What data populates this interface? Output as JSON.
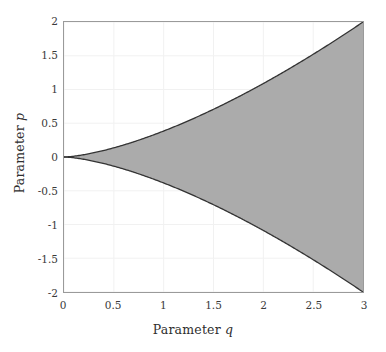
{
  "chart_data": {
    "type": "area",
    "title": "",
    "subtitle": "",
    "xlabel_text": "Parameter",
    "xlabel_symbol": "q",
    "ylabel_text": "Parameter",
    "ylabel_symbol": "p",
    "xlim": [
      0,
      3
    ],
    "ylim": [
      -2,
      2
    ],
    "xticks": [
      0,
      0.5,
      1,
      1.5,
      2,
      2.5,
      3
    ],
    "xticklabels": [
      "0",
      "0.5",
      "1",
      "1.5",
      "2",
      "2.5",
      "3"
    ],
    "yticks": [
      2,
      1.5,
      1,
      0.5,
      0,
      -0.5,
      -1,
      -1.5,
      -2
    ],
    "yticklabels": [
      "2",
      "1.5",
      "1",
      "0.5",
      "0",
      "-0.5",
      "-1",
      "-1.5",
      "-2"
    ],
    "grid": true,
    "grid_color": "#f1f1f1",
    "axis_color": "#9a9a9a",
    "legend": null,
    "legend_position": "none",
    "fill_color": "#ababab",
    "line_color": "#333333",
    "region_label": "shaded stability region",
    "series": [
      {
        "name": "upper boundary",
        "x": [
          0,
          0.15,
          0.3,
          0.45,
          0.6,
          0.75,
          0.9,
          1.0,
          1.2,
          1.35,
          1.5,
          1.65,
          1.8,
          2.0,
          2.1,
          2.25,
          2.4,
          2.55,
          2.7,
          2.85,
          3.0
        ],
        "y": [
          0,
          0.071,
          0.2,
          0.367,
          0.566,
          0.791,
          1.04,
          0.471,
          0.619,
          0.738,
          0.745,
          0.857,
          0.98,
          1.16,
          1.246,
          1.369,
          1.507,
          1.65,
          1.8,
          1.955,
          2.0
        ]
      },
      {
        "name": "lower boundary",
        "x": [
          0,
          0.15,
          0.3,
          0.45,
          0.6,
          0.75,
          0.9,
          1.0,
          1.2,
          1.35,
          1.5,
          1.65,
          1.8,
          2.0,
          2.1,
          2.25,
          2.4,
          2.55,
          2.7,
          2.85,
          3.0
        ],
        "y": [
          0,
          -0.071,
          -0.2,
          -0.367,
          -0.566,
          -0.791,
          -1.04,
          -0.471,
          -0.619,
          -0.738,
          -0.745,
          -0.857,
          -0.98,
          -1.16,
          -1.246,
          -1.369,
          -1.507,
          -1.65,
          -1.8,
          -1.955,
          -2.0
        ]
      }
    ],
    "boundary_formula": "p = +/- 2*(q/3)^1.5"
  }
}
